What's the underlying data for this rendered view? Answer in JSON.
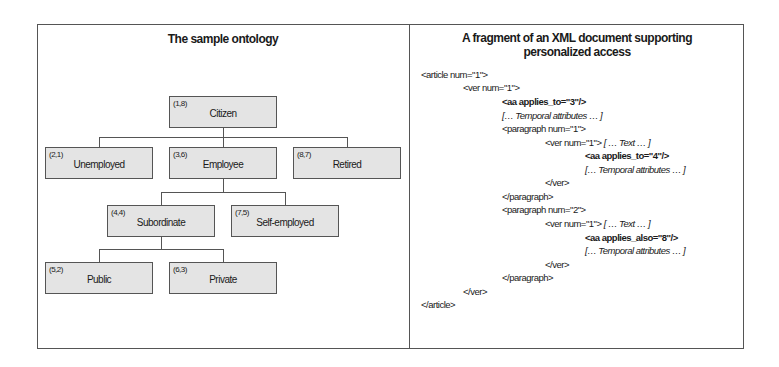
{
  "left_panel": {
    "title": "The sample ontology",
    "nodes": [
      {
        "id": "citizen",
        "code": "(1,8)",
        "label": "Citizen"
      },
      {
        "id": "unemployed",
        "code": "(2,1)",
        "label": "Unemployed"
      },
      {
        "id": "employee",
        "code": "(3,6)",
        "label": "Employee"
      },
      {
        "id": "retired",
        "code": "(8,7)",
        "label": "Retired"
      },
      {
        "id": "subordinate",
        "code": "(4,4)",
        "label": "Subordinate"
      },
      {
        "id": "self-employed",
        "code": "(7,5)",
        "label": "Self-employed"
      },
      {
        "id": "public",
        "code": "(5,2)",
        "label": "Public"
      },
      {
        "id": "private",
        "code": "(6,3)",
        "label": "Private"
      }
    ],
    "edges": [
      [
        "Citizen",
        "Unemployed"
      ],
      [
        "Citizen",
        "Employee"
      ],
      [
        "Citizen",
        "Retired"
      ],
      [
        "Employee",
        "Subordinate"
      ],
      [
        "Employee",
        "Self-employed"
      ],
      [
        "Subordinate",
        "Public"
      ],
      [
        "Subordinate",
        "Private"
      ]
    ]
  },
  "right_panel": {
    "title_line1": "A fragment of an XML document supporting",
    "title_line2": "personalized access",
    "lines": [
      {
        "text": "<article num=\"1\">",
        "extra": ""
      },
      {
        "text": "<ver num=\"1\">",
        "extra": ""
      },
      {
        "text": "<aa applies_to=\"3\"/>",
        "extra": ""
      },
      {
        "text": "",
        "extra": "[… Temporal attributes … ]"
      },
      {
        "text": "<paragraph num=\"1\">",
        "extra": ""
      },
      {
        "text": "<ver num=\"1\"> ",
        "extra": "[ … Text … ]"
      },
      {
        "text": "<aa applies_to=\"4\"/>",
        "extra": ""
      },
      {
        "text": "",
        "extra": "[… Temporal attributes … ]"
      },
      {
        "text": "</ver>",
        "extra": ""
      },
      {
        "text": "</paragraph>",
        "extra": ""
      },
      {
        "text": "<paragraph num=\"2\">",
        "extra": ""
      },
      {
        "text": "<ver num=\"1\"> ",
        "extra": "[ … Text … ]"
      },
      {
        "text": "<aa applies_also=\"8\"/>",
        "extra": ""
      },
      {
        "text": "",
        "extra": "[… Temporal attributes … ]"
      },
      {
        "text": "</ver>",
        "extra": ""
      },
      {
        "text": "</paragraph>",
        "extra": ""
      },
      {
        "text": "</ver>",
        "extra": ""
      },
      {
        "text": "</article>",
        "extra": ""
      }
    ]
  }
}
